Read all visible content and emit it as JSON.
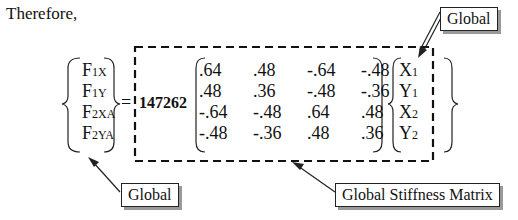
{
  "intro": "Therefore,",
  "force_vector": [
    {
      "base": "F",
      "sub": "1X"
    },
    {
      "base": "F",
      "sub": "1Y"
    },
    {
      "base": "F",
      "sub": "2XA"
    },
    {
      "base": "F",
      "sub": "2YA"
    }
  ],
  "equals": "=",
  "scalar": "147262",
  "matrix": [
    [
      ".64",
      ".48",
      "-.64",
      "-.48"
    ],
    [
      ".48",
      ".36",
      "-.48",
      "-.36"
    ],
    [
      "-.64",
      "-.48",
      ".64",
      ".48"
    ],
    [
      "-.48",
      "-.36",
      ".48",
      ".36"
    ]
  ],
  "disp_vector": [
    {
      "base": "X",
      "sub": "1"
    },
    {
      "base": "Y",
      "sub": "1"
    },
    {
      "base": "X",
      "sub": "2"
    },
    {
      "base": "Y",
      "sub": "2"
    }
  ],
  "callouts": {
    "top_right": "Global",
    "bottom_left": "Global",
    "bottom_right": "Global Stiffness Matrix"
  }
}
